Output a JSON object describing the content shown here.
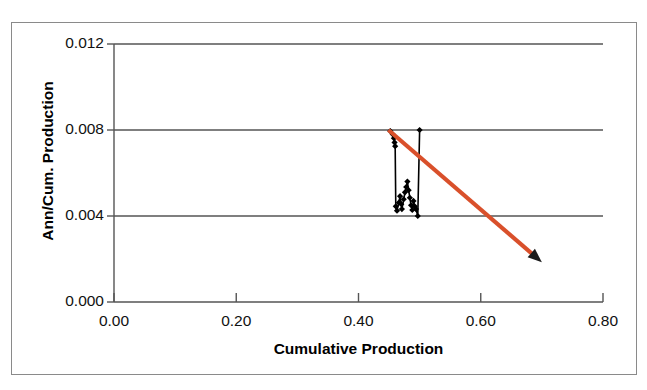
{
  "chart_data": {
    "type": "scatter",
    "title": "",
    "xlabel": "Cumulative Production",
    "ylabel": "Ann/Cum. Production",
    "xlim": [
      0.0,
      0.8
    ],
    "ylim": [
      0.0,
      0.012
    ],
    "xticks": [
      "0.00",
      "0.20",
      "0.40",
      "0.60",
      "0.80"
    ],
    "xtick_values": [
      0.0,
      0.2,
      0.4,
      0.6,
      0.8
    ],
    "yticks": [
      "0.000",
      "0.004",
      "0.008",
      "0.012"
    ],
    "ytick_values": [
      0.0,
      0.004,
      0.008,
      0.012
    ],
    "grid": "horizontal",
    "legend": "none",
    "series": [
      {
        "name": "Ann/Cum. Production vs Cumulative Production",
        "marker": "diamond",
        "marker_color": "#000000",
        "line_color": "#000000",
        "connected": true,
        "points": [
          [
            0.452,
            0.00795
          ],
          [
            0.456,
            0.0078
          ],
          [
            0.458,
            0.00762
          ],
          [
            0.459,
            0.00742
          ],
          [
            0.46,
            0.00725
          ],
          [
            0.461,
            0.00445
          ],
          [
            0.463,
            0.00425
          ],
          [
            0.466,
            0.00462
          ],
          [
            0.468,
            0.00492
          ],
          [
            0.47,
            0.00455
          ],
          [
            0.471,
            0.00432
          ],
          [
            0.474,
            0.00478
          ],
          [
            0.476,
            0.0051
          ],
          [
            0.478,
            0.00535
          ],
          [
            0.48,
            0.0056
          ],
          [
            0.482,
            0.0052
          ],
          [
            0.484,
            0.00485
          ],
          [
            0.486,
            0.0045
          ],
          [
            0.488,
            0.00428
          ],
          [
            0.49,
            0.0047
          ],
          [
            0.492,
            0.00445
          ],
          [
            0.494,
            0.00432
          ],
          [
            0.497,
            0.004
          ],
          [
            0.5,
            0.008
          ]
        ]
      }
    ],
    "annotations": [
      {
        "type": "arrow",
        "name": "trend-arrow",
        "color": "#d9502b",
        "from": [
          0.449,
          0.008
        ],
        "to": [
          0.7,
          0.00185
        ],
        "description": "Red-orange declining trend arrow"
      }
    ]
  },
  "axis_titles": {
    "x": "Cumulative Production",
    "y": "Ann/Cum. Production"
  }
}
